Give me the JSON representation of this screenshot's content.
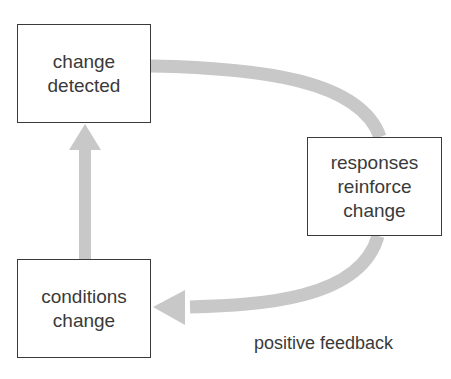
{
  "diagram": {
    "title": "positive feedback",
    "nodes": [
      {
        "id": "change-detected",
        "lines": [
          "change",
          "detected"
        ]
      },
      {
        "id": "responses-reinforce-change",
        "lines": [
          "responses",
          "reinforce",
          "change"
        ]
      },
      {
        "id": "conditions-change",
        "lines": [
          "conditions",
          "change"
        ]
      }
    ],
    "edges": [
      {
        "from": "change-detected",
        "to": "responses-reinforce-change"
      },
      {
        "from": "responses-reinforce-change",
        "to": "conditions-change"
      },
      {
        "from": "conditions-change",
        "to": "change-detected"
      }
    ],
    "colors": {
      "arrow": "#c8c8c8",
      "border": "#3a3a3a",
      "text": "#3a3a3a"
    }
  }
}
